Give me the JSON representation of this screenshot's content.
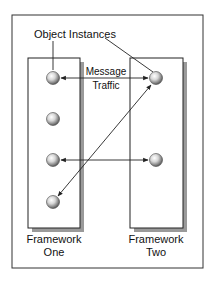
{
  "diagram": {
    "callout_label": "Object Instances",
    "message_label_line1": "Message",
    "message_label_line2": "Traffic",
    "frameworks": [
      {
        "name": "framework-one",
        "label_line1": "Framework",
        "label_line2": "One",
        "object_count": 4
      },
      {
        "name": "framework-two",
        "label_line1": "Framework",
        "label_line2": "Two",
        "object_count": 2
      }
    ],
    "messages": [
      {
        "from": "framework-one.object-1",
        "to": "framework-two.object-1",
        "direction": "bidirectional"
      },
      {
        "from": "framework-one.object-3",
        "to": "framework-two.object-2",
        "direction": "bidirectional"
      },
      {
        "from": "framework-two.object-1",
        "to": "framework-one.object-4",
        "direction": "bidirectional"
      }
    ],
    "colors": {
      "line": "#222222",
      "shadow": "#9a9a9a",
      "ball_light": "#ffffff",
      "ball_dark": "#6e6e6e"
    }
  }
}
